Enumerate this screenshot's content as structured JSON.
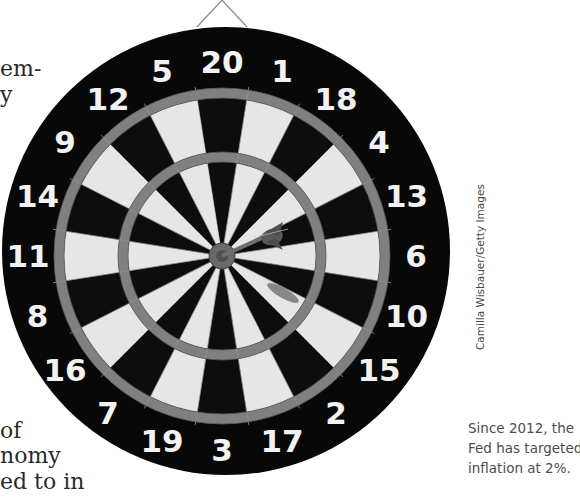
{
  "body_text_fragments": [
    {
      "text": "em-",
      "x": 0,
      "y": 66
    },
    {
      "text": "y",
      "x": 0,
      "y": 92
    },
    {
      "text": "of",
      "x": 0,
      "y": 426
    },
    {
      "text": "nomy",
      "x": 0,
      "y": 451
    },
    {
      "text": "ed to in",
      "x": 0,
      "y": 479
    }
  ],
  "figure": {
    "sector_numbers_clockwise_from_top": [
      "20",
      "1",
      "18",
      "4",
      "13",
      "6",
      "10",
      "15",
      "2",
      "17",
      "3",
      "19",
      "7",
      "16",
      "8",
      "11",
      "14",
      "9",
      "12",
      "5"
    ],
    "dart_location": "right of bullseye, in sector 6 / 13 boundary",
    "colors": {
      "board_black": "#080808",
      "segment_light": "#e6e6e6",
      "segment_dark": "#0d0d0d",
      "ring": "#808080",
      "numbers": "#f2f2f2"
    }
  },
  "photo_credit": "Camilla Wisbauer/Getty Images",
  "caption": {
    "lines": [
      "Since 2012, the",
      "Fed has targeted",
      "inflation at 2%."
    ]
  }
}
